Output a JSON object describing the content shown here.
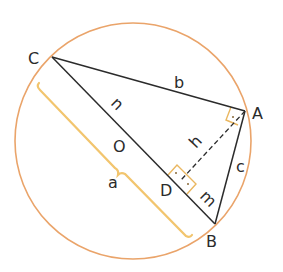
{
  "diagram": {
    "type": "geometry",
    "colors": {
      "circle": "#eaa46a",
      "lines": "#2b2b2b",
      "bracket": "#f2c56e",
      "right_angle": "#eab760"
    },
    "points": {
      "C": {
        "label": "C",
        "x": 52,
        "y": 57
      },
      "A": {
        "label": "A",
        "x": 245,
        "y": 111
      },
      "B": {
        "label": "B",
        "x": 215,
        "y": 224
      },
      "O": {
        "label": "O",
        "x": 133,
        "y": 141
      },
      "D": {
        "label": "D",
        "x": 183,
        "y": 190
      }
    },
    "segment_labels": {
      "b": "b",
      "c": "c",
      "h": "h",
      "n": "n",
      "m": "m",
      "a": "a"
    }
  }
}
